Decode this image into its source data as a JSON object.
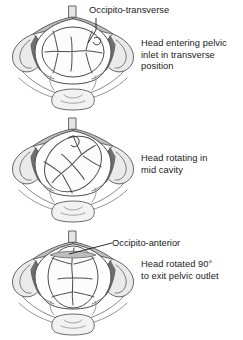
{
  "figure": {
    "background": "#ffffff",
    "text_color": "#1a1a1a",
    "palette": {
      "bone_outline": "#555555",
      "bone_fill": "#ffffff",
      "ilium_fill": "#d8d8d8",
      "ligament_dark": "#6e6e6e",
      "ligament_mid": "#9a9a9a",
      "skull_fill": "#fbfbfb",
      "suture_line": "#4a4a4a",
      "leader_line": "#1a1a1a"
    }
  },
  "panels": [
    {
      "id": "panel-0",
      "name": "pelvic-inlet-transverse",
      "callout": "Occipito-transverse",
      "caption": "Head entering pelvic\ninlet in transverse\nposition",
      "head_rotation_deg": 0,
      "stage": "inlet"
    },
    {
      "id": "panel-1",
      "name": "mid-cavity-rotating",
      "callout": "",
      "caption": "Head rotating in\nmid cavity",
      "head_rotation_deg": 45,
      "stage": "mid-cavity"
    },
    {
      "id": "panel-2",
      "name": "pelvic-outlet-anterior",
      "callout": "Occipito-anterior",
      "caption": "Head rotated 90°\nto exit pelvic outlet",
      "head_rotation_deg": 90,
      "stage": "outlet"
    }
  ]
}
